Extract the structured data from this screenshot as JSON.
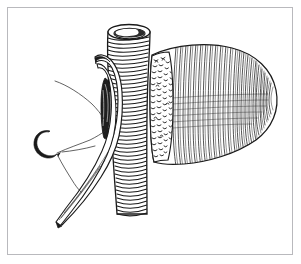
{
  "figure": {
    "title": "Surgical illustration: forceps grasping vessel adjacent to conical organ with curved suture needle",
    "caption": "",
    "style": "black-and-white pen-and-ink line drawing with hatching and stippling",
    "background_color": "#ffffff",
    "ink_color": "#1a1a1a",
    "frame": {
      "name": "illustration-border",
      "color": "#b9b9bd",
      "thickness_px": 1,
      "inset_px": 7,
      "width_px": 286,
      "height_px": 248
    },
    "canvas": {
      "width_px": 301,
      "height_px": 264
    }
  },
  "elements": {
    "tube": {
      "label": "vertical tubular vessel",
      "description": "Vertically oriented cut tube running top to bottom with an open elliptical lumen at the top and transverse ring striations along its length",
      "top_opening_label": "open lumen",
      "ring_count": 46,
      "color": "#1a1a1a"
    },
    "organ": {
      "label": "conical organ mass",
      "description": "Large cone-shaped organ to the right of the tube, rendered with fine vertical hatching and a stippled cut-surface band along its left margin",
      "texture_left": "stipple",
      "texture_body": "vertical hatching",
      "hatch_count": 52,
      "stipple_count": 150,
      "color": "#1a1a1a"
    },
    "forceps": {
      "label": "curved forceps",
      "description": "Two-bladed curved surgical forceps entering from lower left, tips grasping tissue against the tube at a dark shadowed grip point",
      "tip_shadow_label": "grasped tissue shadow",
      "color": "#1a1a1a"
    },
    "needle": {
      "label": "curved suture needle",
      "description": "Crescent-shaped suture needle at middle left with attached thread",
      "color": "#1a1a1a"
    },
    "suture": {
      "label": "suture thread",
      "description": "Thin thread running from the needle up and to the right toward the forceps tip and the grip point",
      "color": "#3a3a3a"
    }
  }
}
